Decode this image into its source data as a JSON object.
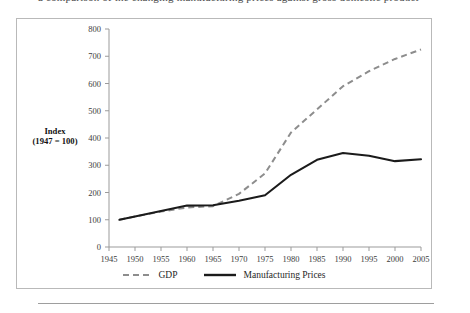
{
  "page": {
    "top_caption": "a comparison of the changing manufacturing prices against gross domestic product"
  },
  "chart_data": {
    "type": "line",
    "title": "",
    "xlabel": "",
    "ylabel": "Index\n(1947 = 100)",
    "ylabel_line1": "Index",
    "ylabel_line2": "(1947 = 100)",
    "xlim": [
      1945,
      2005
    ],
    "ylim": [
      0,
      800
    ],
    "yticks": [
      0,
      100,
      200,
      300,
      400,
      500,
      600,
      700,
      800
    ],
    "xticks": [
      1945,
      1950,
      1955,
      1960,
      1965,
      1970,
      1975,
      1980,
      1985,
      1990,
      1995,
      2000,
      2005
    ],
    "grid": false,
    "legend_position": "bottom",
    "x": [
      1947,
      1950,
      1955,
      1960,
      1965,
      1970,
      1975,
      1980,
      1985,
      1990,
      1995,
      2000,
      2005
    ],
    "series": [
      {
        "name": "GDP",
        "style": "dashed",
        "color": "#8d8d8d",
        "values": [
          100,
          112,
          130,
          145,
          150,
          195,
          270,
          420,
          505,
          590,
          645,
          690,
          725
        ]
      },
      {
        "name": "Manufacturing Prices",
        "style": "solid",
        "color": "#1b1b1b",
        "values": [
          100,
          112,
          132,
          152,
          153,
          170,
          190,
          265,
          320,
          345,
          335,
          315,
          322
        ]
      }
    ]
  },
  "legend": {
    "items": [
      {
        "label": "GDP",
        "style": "dashed",
        "color": "#8d8d8d"
      },
      {
        "label": "Manufacturing Prices",
        "style": "solid",
        "color": "#1b1b1b"
      }
    ]
  }
}
